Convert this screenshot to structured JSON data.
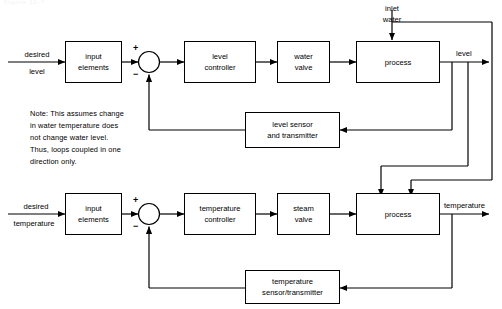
{
  "diagram": {
    "title_faint": "Figure 11-7",
    "note": "Note: This assumes change\nin water temperature does\nnot change water level.\nThus, loops coupled in one\ndirection only.",
    "blocks": {
      "level_input_elements": "input\nelements",
      "level_controller": "level\ncontroller",
      "water_valve": "water\nvalve",
      "level_process": "process",
      "level_sensor": "level sensor\nand transmitter",
      "temp_input_elements": "input\nelements",
      "temp_controller": "temperature\ncontroller",
      "steam_valve": "steam\nvalve",
      "temp_process": "process",
      "temp_sensor": "temperature\nsensor/transmitter"
    },
    "labels": {
      "desired_level_line1": "desired",
      "desired_level_line2": "level",
      "desired_temp_line1": "desired",
      "desired_temp_line2": "temperature",
      "inlet_water": "inlet\nwater",
      "level_output": "level",
      "temperature_output": "temperature",
      "plus_top": "+",
      "minus_top": "−",
      "plus_bottom": "+",
      "minus_bottom": "−"
    },
    "colors": {
      "line": "#000000",
      "background": "#ffffff",
      "text": "#000000"
    }
  }
}
